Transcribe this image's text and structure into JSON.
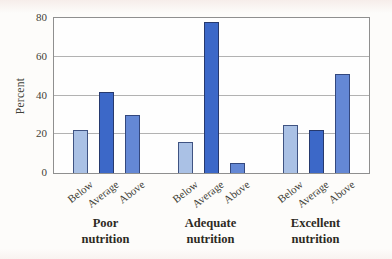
{
  "chart_data": {
    "type": "bar",
    "title": "",
    "ylabel": "Percent",
    "ylim": [
      0,
      80
    ],
    "yticks": [
      0,
      20,
      40,
      60,
      80
    ],
    "grid": true,
    "legend": "none",
    "x_tick_mode": "per-bar-rotated",
    "categories": [
      "Poor nutrition",
      "Adequate nutrition",
      "Excellent nutrition"
    ],
    "category_label_lines": [
      [
        "Poor",
        "nutrition"
      ],
      [
        "Adequate",
        "nutrition"
      ],
      [
        "Excellent",
        "nutrition"
      ]
    ],
    "series": [
      {
        "name": "Below",
        "values": [
          22,
          16,
          25
        ],
        "color": "#aac1e5",
        "border": "#3f5382"
      },
      {
        "name": "Average",
        "values": [
          42,
          78,
          22
        ],
        "color": "#3c68c8",
        "border": "#26396e"
      },
      {
        "name": "Above",
        "values": [
          30,
          5,
          51
        ],
        "color": "#6488d5",
        "border": "#33487e"
      }
    ]
  },
  "colors": {
    "background": "#fcfaf7",
    "plot_background": "#fefefe",
    "plot_border": "#8f8f8f",
    "gridline": "#b2b2b2",
    "axis_text": "#3f3f37",
    "group_label_text": "#2d2a23"
  }
}
